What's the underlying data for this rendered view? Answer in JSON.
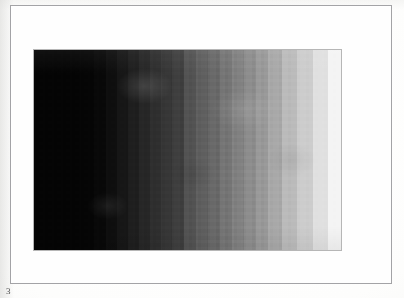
{
  "document": {
    "page_number_label": "3",
    "background_color": "#f4f4f2",
    "page_frame_border_color": "#a3a3a6",
    "page_frame_fill_color": "#fefefe"
  },
  "figure": {
    "name": "grayscale-step-wedge",
    "border_color": "#b6b6b6"
  },
  "chart_data": {
    "type": "heatmap",
    "title": "",
    "subtitle": "",
    "xlabel": "",
    "ylabel": "",
    "grid": false,
    "legend": "none",
    "orientation": "horizontal",
    "categories": [
      "step-1",
      "step-2",
      "step-3",
      "step-4",
      "step-5",
      "step-6",
      "step-7",
      "step-8",
      "step-9",
      "step-10",
      "step-11",
      "step-12",
      "step-13",
      "step-14",
      "step-15",
      "step-16",
      "step-17",
      "step-18",
      "step-19",
      "step-20",
      "step-21",
      "step-22"
    ],
    "values": [
      4,
      5,
      8,
      14,
      22,
      30,
      38,
      46,
      54,
      62,
      82,
      94,
      104,
      116,
      128,
      140,
      152,
      168,
      186,
      204,
      224,
      244
    ],
    "band_widths_px": [
      46,
      14,
      12,
      12,
      11,
      11,
      11,
      11,
      11,
      12,
      12,
      12,
      12,
      12,
      12,
      12,
      13,
      14,
      15,
      16,
      15,
      13
    ],
    "colors": [
      "#040404",
      "#050505",
      "#080808",
      "#0e0e0e",
      "#161616",
      "#1e1e1e",
      "#262626",
      "#2e2e2e",
      "#363636",
      "#3e3e3e",
      "#525252",
      "#5e5e5e",
      "#686868",
      "#747474",
      "#808080",
      "#8c8c8c",
      "#989898",
      "#a8a8a8",
      "#bababa",
      "#cccccc",
      "#e0e0e0",
      "#f4f4f4"
    ],
    "ylim": [
      0,
      255
    ],
    "xlim": [
      0,
      22
    ],
    "value_axis_label": "gray level (0-255)"
  }
}
